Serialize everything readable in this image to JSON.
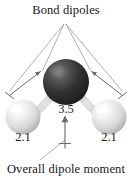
{
  "figure": {
    "title": "Bond dipoles",
    "caption": "Overall dipole moment",
    "molecule": {
      "name": "water-molecule",
      "central_atom": {
        "label": "oxygen-atom",
        "electronegativity": "3.5",
        "color": "#2b2b2b",
        "highlight_color": "#6e6e6e"
      },
      "terminal_atoms": [
        {
          "label": "hydrogen-atom-left",
          "electronegativity": "2.1",
          "color": "#e8e8e8",
          "highlight_color": "#ffffff"
        },
        {
          "label": "hydrogen-atom-right",
          "electronegativity": "2.1",
          "color": "#e8e8e8",
          "highlight_color": "#ffffff"
        }
      ],
      "bond_color": "#b5b5b5"
    },
    "vectors": {
      "bond_dipole_left": "arrow pointing from hydrogen toward oxygen",
      "bond_dipole_right": "arrow pointing from hydrogen toward oxygen",
      "overall_dipole": "vertical arrow pointing up",
      "arrow_color": "#6a6a6a",
      "leader_color": "#9a9a9a"
    }
  }
}
